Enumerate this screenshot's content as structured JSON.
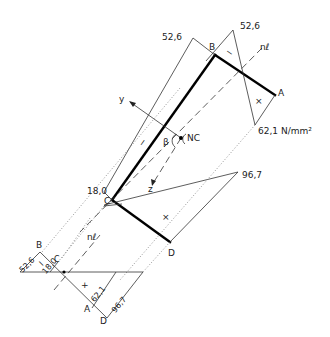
{
  "diagram": {
    "title": "",
    "upper_view": {
      "points": {
        "A": "A",
        "B": "B",
        "C": "C",
        "D": "D"
      },
      "neutral_axis_label": "nℓ",
      "neutral_center_label": "NC",
      "angle_label": "β",
      "axis_y_label": "y",
      "axis_z_label": "z",
      "stress_values": {
        "B_web_side": "52,6",
        "B_flange_side": "52,6",
        "A": "62,1 N/mm²",
        "C": "18,0",
        "D": "96,7"
      },
      "sign_marks": {
        "web_top": "−",
        "flange_top": "−",
        "flange_top_right": "×",
        "flange_bottom": "×"
      }
    },
    "lower_view": {
      "points": {
        "B": "B",
        "C": "C",
        "A": "A",
        "D": "D"
      },
      "neutral_axis_label": "nℓ",
      "stress_values": {
        "B": "52,6",
        "C": "18,0",
        "A": "62,1",
        "D": "96,7"
      },
      "sign_marks": {
        "compression": "−",
        "tension": "+"
      }
    }
  }
}
